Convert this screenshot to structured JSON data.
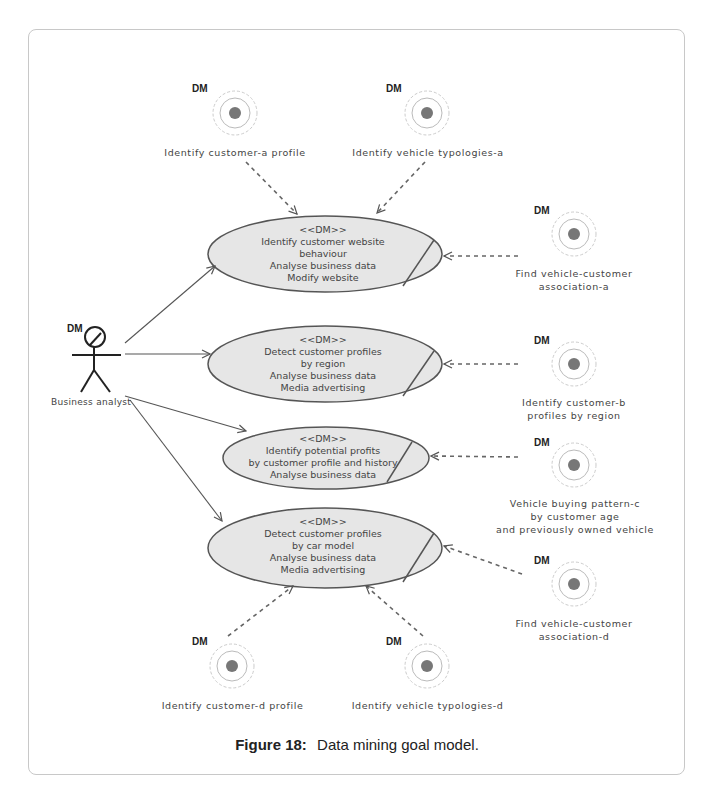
{
  "figure": {
    "caption_label": "Figure 18:",
    "caption_text": "Data mining goal  model."
  },
  "actor": {
    "stereotype": "DM",
    "name": "Business analyst"
  },
  "use_cases": [
    {
      "stereotype": "<<DM>>",
      "lines": [
        "Identify customer website",
        "behaviour",
        "Analyse business data",
        "Modify website"
      ]
    },
    {
      "stereotype": "<<DM>>",
      "lines": [
        "Detect customer profiles",
        "by region",
        "Analyse business data",
        "Media advertising"
      ]
    },
    {
      "stereotype": "<<DM>>",
      "lines": [
        "Identify potential profits",
        "by customer profile and history",
        "Analyse business data"
      ]
    },
    {
      "stereotype": "<<DM>>",
      "lines": [
        "Detect customer profiles",
        "by car model",
        "Analyse business data",
        "Media advertising"
      ]
    }
  ],
  "goals": [
    {
      "tag": "DM",
      "label": [
        "Identify customer-a profile"
      ]
    },
    {
      "tag": "DM",
      "label": [
        "Identify vehicle typologies-a"
      ]
    },
    {
      "tag": "DM",
      "label": [
        "Find vehicle-customer",
        "association-a"
      ]
    },
    {
      "tag": "DM",
      "label": [
        "Identify customer-b",
        "profiles by region"
      ]
    },
    {
      "tag": "DM",
      "label": [
        "Vehicle buying pattern-c",
        "by customer age",
        "and previously owned vehicle"
      ]
    },
    {
      "tag": "DM",
      "label": [
        "Find vehicle-customer",
        "association-d"
      ]
    },
    {
      "tag": "DM",
      "label": [
        "Identify customer-d profile"
      ]
    },
    {
      "tag": "DM",
      "label": [
        "Identify vehicle typologies-d"
      ]
    }
  ],
  "colors": {
    "ellipse_fill": "#e6e6e6",
    "ellipse_stroke": "#555555",
    "goal_dot": "#777777",
    "goal_ring": "#bbbbbb",
    "frame": "#c8c8c8"
  }
}
